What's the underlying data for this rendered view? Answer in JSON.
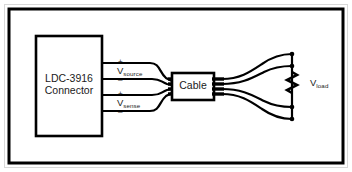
{
  "figure": {
    "background_color": "#ffffff",
    "line_color": "#000000",
    "text_color": "#1a1a1a",
    "border_color": "#d8d8d8"
  },
  "blocks": {
    "connector": {
      "label_line1": "LDC-3916",
      "label_line2": "Connector"
    },
    "cable": {
      "label": "Cable"
    }
  },
  "signals": {
    "source": {
      "name": "V",
      "subscript": "source",
      "plus": "+",
      "minus": "–"
    },
    "sense": {
      "name": "V",
      "subscript": "sense",
      "plus": "+",
      "minus": "–"
    },
    "load": {
      "name": "V",
      "subscript": "load"
    }
  },
  "icons": {
    "resistor": "resistor-zigzag-icon",
    "junction": "junction-dot-icon",
    "wire": "wire-icon"
  }
}
